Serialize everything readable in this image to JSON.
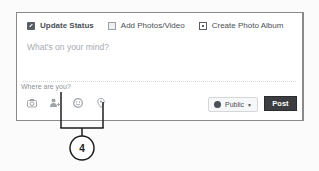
{
  "composer": {
    "tabs": [
      {
        "label": "Update Status",
        "icon": "pencil-icon",
        "active": true
      },
      {
        "label": "Add Photos/Video",
        "icon": "photo-icon",
        "active": false
      },
      {
        "label": "Create Photo Album",
        "icon": "album-icon",
        "active": false
      }
    ],
    "placeholder": "What's on your mind?",
    "location_placeholder": "Where are you?",
    "action_icons": [
      "camera-icon",
      "tag-friends-icon",
      "feeling-icon",
      "location-pin-icon"
    ],
    "audience": {
      "label": "Public",
      "icon": "globe-icon"
    },
    "post_label": "Post"
  },
  "callout": {
    "number": "4",
    "color": "#222222"
  },
  "colors": {
    "post_button": "#3b3d40",
    "border": "#8a8a8a",
    "placeholder_text": "#a7abb1"
  }
}
